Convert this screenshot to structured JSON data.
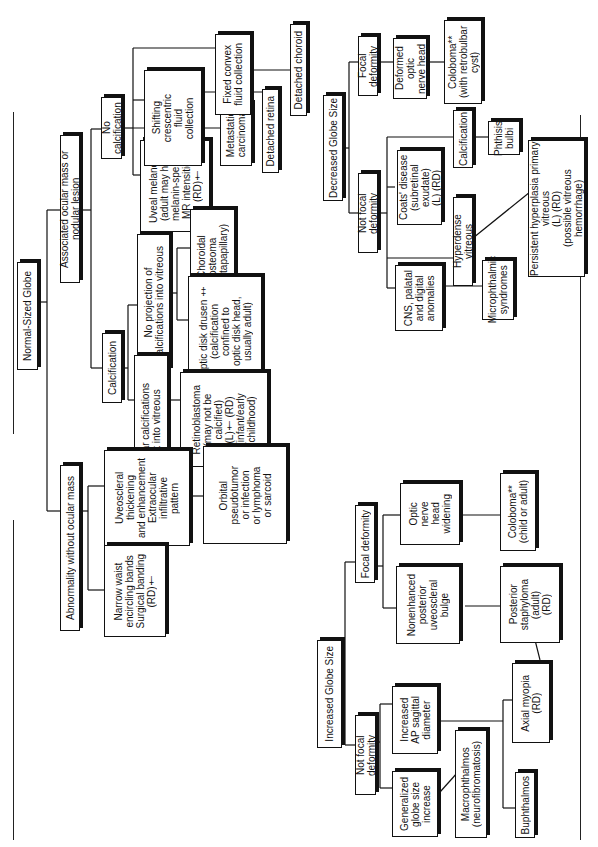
{
  "figure": {
    "type": "flowchart",
    "orientation": "rotated 90deg counter-clockwise (text reads bottom-to-top)",
    "trees": [
      {
        "root": "Normal-Sized Globe",
        "branches": [
          "Associated ocular mass or nodular lesion",
          "Abnormality without ocular mass"
        ]
      },
      {
        "root": "Decreased Globe Size",
        "branches": [
          "Focal deformity",
          "Not focal deformity"
        ]
      },
      {
        "root": "Increased Globe Size",
        "branches": [
          "Focal deformity",
          "Not focal deformity"
        ]
      }
    ]
  },
  "nodes": {
    "normal_globe": "Normal-Sized Globe",
    "assoc_mass": "Associated ocular mass or nodular lesion",
    "abn_without_mass": "Abnormality without ocular mass",
    "no_calcification": "No calcification",
    "calcification_normal": "Calcification",
    "uveal_melanoma": "Uveal melanoma\n(adult may have\nmelanin-specific\nMR intensities)\n(RD)†",
    "metastatic_carcinoma": "Metastatic\ncarcinoma",
    "shifting_fluid": "Shifting\ncrescentric\nfluid\ncollection",
    "fixed_fluid": "Fixed convex\nfluid collection",
    "detached_retina": "Detached retina",
    "detached_choroid": "Detached choroid",
    "no_projection": "No projection of\ncalcifications into vitreous",
    "choroidal_osteoma": "Choroidal\nosteoma\n(juxtapapillary)",
    "optic_disk_drusen": "Optic disk drusen ‡\n(calcification\nconfined to\noptic disk head,\nusually adult)",
    "floccular": "Floccular calcifications\nproject into vitreous",
    "retinoblastoma": "Retinoblastoma\n(may not be\ncalcified)\n(L)† (RD)\n(infant/early\nchildhood)",
    "uveoscleral": "Uveoscleral\nthickening\nand enhancement\nExtraocular\ninfiltrative\npattern",
    "orbital_pseudotumor": "Orbital\npseudotumor\nor infection\nor lymphoma\nor sarcoid",
    "narrow_waist": "Narrow waist\nencircling bands\nSurgical banding\n(RD)†",
    "decreased_globe": "Decreased Globe Size",
    "dec_focal": "Focal deformity",
    "deformed_optic": "Deformed optic\nnerve head",
    "coloboma_retro": "Coloboma**\n(with retrobulbar cyst)",
    "dec_not_focal": "Not focal deformity",
    "calcification_dec": "Calcification",
    "phthisis": "Phthisis\nbulbi",
    "coats": "Coats' disease\n(subretinal exudate)\n(L) (RD)",
    "hyperdense": "Hyperdense vitreous",
    "phpv": "Persistent hyperplasia primary\nvitreous\n(L) (RD)\n(possible vitreous hemorrhage)",
    "cns": "CNS, palatal\nand digital\nanomalies",
    "microphthalmic": "Microphthalmic\nsyndromes",
    "increased_globe": "Increased Globe Size",
    "inc_focal": "Focal deformity",
    "optic_widening": "Optic\nnerve\nhead\nwidening",
    "coloboma_child": "Coloboma**\n(child or adult)",
    "nonenhanced": "Nonenhanced\nposterior\nuveoscleral\nbulge",
    "staphyloma": "Posterior\nstaphyloma\n(adult)\n(RD)",
    "inc_not_focal": "Not focal deformity",
    "increased_ap": "Increased\nAP sagittal\ndiameter",
    "axial_myopia": "Axial myopia\n(RD)",
    "generalized": "Generalized\nglobe size\nincrease",
    "macrophthalmos": "Macrophthalmos\n(neurofibromatosis)",
    "buphthalmos": "Buphthalmos"
  },
  "colors": {
    "ink": "#111111",
    "background": "#ffffff"
  }
}
